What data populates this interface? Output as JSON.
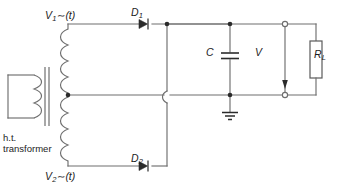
{
  "figure": {
    "background_color": "#ffffff",
    "wire_color": "#6e6e6e",
    "component_color": "#2b2b2b",
    "text_color": "#1c1c1c",
    "width": 339,
    "height": 190
  },
  "labels": {
    "source_top": {
      "symbol": "V",
      "subscript": "1",
      "tilde": "∼",
      "argument": "(t)",
      "full": "V1~(t)"
    },
    "source_bottom": {
      "symbol": "V",
      "subscript": "2",
      "tilde": "∼",
      "argument": "(t)",
      "full": "V2~(t)"
    },
    "diode_top": {
      "symbol": "D",
      "subscript": "1",
      "full": "D1"
    },
    "diode_bottom": {
      "symbol": "D",
      "subscript": "2",
      "full": "D2"
    },
    "capacitor": {
      "symbol": "C",
      "full": "C"
    },
    "output_voltage": {
      "symbol": "V",
      "full": "V"
    },
    "load_resistor": {
      "symbol": "R",
      "subscript": "L",
      "full": "RL"
    },
    "transformer": {
      "line1": "h.t.",
      "line2": "transformer"
    }
  },
  "components": [
    {
      "name": "ht-transformer",
      "type": "transformer",
      "label": "h.t. transformer",
      "detail": "centre-tapped secondary, iron core"
    },
    {
      "name": "diode-d1",
      "type": "diode",
      "label": "D1",
      "orientation": "anode-left cathode-right"
    },
    {
      "name": "diode-d2",
      "type": "diode",
      "label": "D2",
      "orientation": "anode-left cathode-right"
    },
    {
      "name": "capacitor-c",
      "type": "capacitor",
      "label": "C",
      "orientation": "vertical"
    },
    {
      "name": "load-resistor-rl",
      "type": "resistor",
      "label": "RL",
      "orientation": "vertical"
    },
    {
      "name": "output-voltage-v",
      "type": "voltage-measurement",
      "label": "V",
      "orientation": "vertical"
    },
    {
      "name": "ground",
      "type": "earth-ground",
      "label": ""
    }
  ]
}
